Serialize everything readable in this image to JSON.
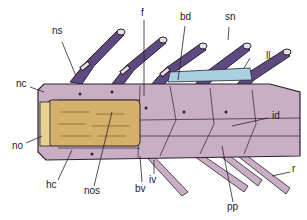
{
  "figure": {
    "colors": {
      "body": "#c9aec4",
      "body_dark": "#a888a2",
      "spine": "#5e4a80",
      "spine_tip": "#e8dfe6",
      "notochord": "#d6b06a",
      "ligament": "#a9cfe0",
      "outline": "#2a2230"
    },
    "labels": {
      "ns": "ns",
      "f": "f",
      "bd": "bd",
      "sn": "sn",
      "ll": "ll",
      "nc": "nc",
      "id": "id",
      "no": "no",
      "hc": "hc",
      "nos": "nos",
      "bv": "bv",
      "iv": "iv",
      "pp": "pp",
      "r": "r"
    }
  }
}
